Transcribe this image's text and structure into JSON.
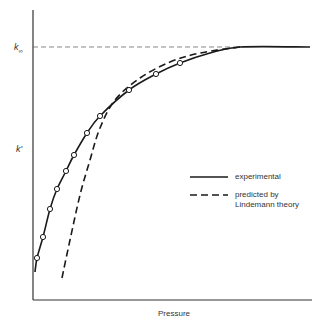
{
  "chart_data": {
    "type": "line",
    "title": "",
    "xlabel": "Pressure",
    "ylabel": "k'",
    "asymptote_label": "k∞",
    "asymptote_label_main": "k",
    "asymptote_label_sub": "∞",
    "grid": false,
    "ticks": "none",
    "legend_position": "right-middle",
    "legend": [
      {
        "name": "experimental",
        "style": "solid"
      },
      {
        "name": "predicted by Lindemann theory",
        "line1": "predicted by",
        "line2": "Lindemann theory",
        "style": "dashed"
      }
    ],
    "series": [
      {
        "name": "experimental",
        "style": "solid",
        "markers": "open-circle",
        "points_px": [
          [
            37,
            258
          ],
          [
            43,
            237
          ],
          [
            50,
            209
          ],
          [
            57,
            189
          ],
          [
            66,
            171
          ],
          [
            74,
            155
          ],
          [
            87,
            133
          ],
          [
            100,
            116
          ],
          [
            129,
            90
          ],
          [
            156,
            74
          ],
          [
            180,
            63
          ]
        ],
        "curve_px": [
          [
            35,
            272
          ],
          [
            37,
            258
          ],
          [
            43,
            237
          ],
          [
            50,
            209
          ],
          [
            57,
            189
          ],
          [
            66,
            171
          ],
          [
            74,
            155
          ],
          [
            87,
            133
          ],
          [
            100,
            116
          ],
          [
            129,
            90
          ],
          [
            156,
            74
          ],
          [
            180,
            63
          ],
          [
            210,
            53
          ],
          [
            240,
            47
          ],
          [
            310,
            47
          ]
        ]
      },
      {
        "name": "predicted by Lindemann theory",
        "style": "dashed",
        "curve_px": [
          [
            62,
            278
          ],
          [
            70,
            240
          ],
          [
            80,
            195
          ],
          [
            90,
            160
          ],
          [
            100,
            128
          ],
          [
            115,
            100
          ],
          [
            140,
            78
          ],
          [
            170,
            62
          ],
          [
            200,
            53
          ],
          [
            240,
            47
          ]
        ]
      }
    ],
    "asymptote": {
      "name": "k∞",
      "style": "thin-dashed",
      "y_px": 47
    }
  },
  "colors": {
    "line": "#1a1a1a",
    "background": "#ffffff"
  }
}
